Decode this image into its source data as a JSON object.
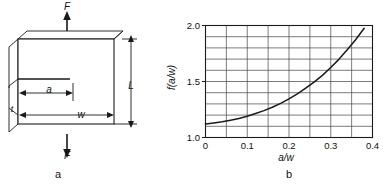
{
  "figure": {
    "panels": [
      {
        "caption": "a",
        "kind": "specimen-diagram"
      },
      {
        "caption": "b",
        "kind": "chart"
      }
    ]
  },
  "specimen": {
    "name": "edge-cracked-plate-under-tension",
    "force_label_top": "F",
    "force_label_bottom": "F",
    "crack_length_label": "a",
    "width_label": "w",
    "length_label": "L",
    "thickness_label": "t",
    "face_color": "#ffffff",
    "edge_color": "#1a1a1a"
  },
  "chart_data": {
    "type": "line",
    "title": "",
    "xlabel": "a/w",
    "ylabel": "f(a/w)",
    "xlim": [
      0,
      0.4
    ],
    "ylim": [
      1.0,
      2.0
    ],
    "xticks": [
      "0",
      "0.1",
      "0.2",
      "0.3",
      "0.4"
    ],
    "xtick_values": [
      0,
      0.1,
      0.2,
      0.3,
      0.4
    ],
    "yticks": [
      "1.0",
      "1.5",
      "2.0"
    ],
    "ytick_values": [
      1.0,
      1.5,
      2.0
    ],
    "grid": true,
    "grid_x_step": 0.05,
    "grid_y_step": 0.1,
    "legend": "none",
    "series": [
      {
        "name": "f(a/w)",
        "color": "#1a1a1a",
        "x": [
          0.0,
          0.02,
          0.04,
          0.06,
          0.08,
          0.1,
          0.12,
          0.14,
          0.16,
          0.18,
          0.2,
          0.22,
          0.24,
          0.26,
          0.28,
          0.3,
          0.32,
          0.34,
          0.36,
          0.38,
          0.4
        ],
        "y": [
          1.12,
          1.13,
          1.14,
          1.155,
          1.17,
          1.19,
          1.215,
          1.24,
          1.27,
          1.305,
          1.345,
          1.39,
          1.44,
          1.495,
          1.555,
          1.625,
          1.7,
          1.785,
          1.875,
          1.975,
          2.09
        ]
      }
    ]
  }
}
